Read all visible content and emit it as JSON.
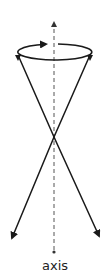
{
  "diagram": {
    "axis_label": "axis",
    "colors": {
      "stroke": "#1a1a1a",
      "axis": "#555555",
      "text": "#222222",
      "background": "#ffffff"
    },
    "elements": {
      "axis": {
        "style": "dashed",
        "x": 54,
        "y_top": 22,
        "y_bottom": 252,
        "arrow_top": true,
        "dot_bottom": true
      },
      "rotation_ellipse": {
        "cx": 54,
        "cy": 52,
        "rx": 37,
        "ry": 8,
        "arrow_direction": "right"
      },
      "cone_lines": [
        {
          "from": [
            18,
            55
          ],
          "through": [
            54,
            137
          ],
          "to": [
            11,
            240
          ],
          "arrow_end": true
        },
        {
          "from": [
            90,
            55
          ],
          "through": [
            54,
            137
          ],
          "to": [
            100,
            238
          ],
          "arrow_end": true
        }
      ],
      "apex": [
        54,
        137
      ]
    }
  }
}
